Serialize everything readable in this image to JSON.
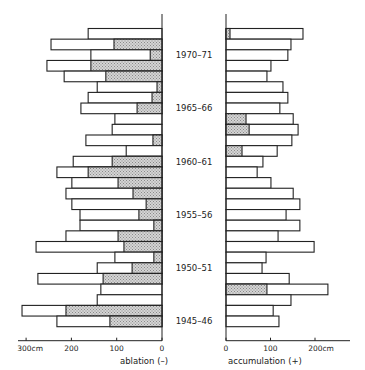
{
  "chart_data": {
    "type": "bar",
    "orientation": "horizontal",
    "title": "",
    "categories": [
      "1972-73",
      "1971-72",
      "1970-71",
      "1969-70",
      "1968-69",
      "1967-68",
      "1966-67",
      "1965-66",
      "1964-65",
      "1963-64",
      "1962-63",
      "1961-62",
      "1960-61",
      "1959-60",
      "1958-59",
      "1957-58",
      "1956-57",
      "1955-56",
      "1954-55",
      "1953-54",
      "1952-53",
      "1951-52",
      "1950-51",
      "1949-50",
      "1948-49",
      "1947-48",
      "1946-47",
      "1945-46"
    ],
    "year_labels": [
      "1970–71",
      "1965–66",
      "1960–61",
      "1955–56",
      "1950–51",
      "1945–46"
    ],
    "series": [
      {
        "name": "ablation total (-)",
        "side": "left",
        "values": [
          163,
          245,
          157,
          254,
          216,
          143,
          163,
          179,
          104,
          110,
          168,
          79,
          196,
          232,
          199,
          212,
          199,
          181,
          181,
          212,
          278,
          104,
          143,
          274,
          135,
          143,
          309,
          232
        ]
      },
      {
        "name": "ablation shaded portion (-)",
        "side": "left",
        "values": [
          0,
          106,
          26,
          157,
          124,
          11,
          22,
          55,
          0,
          0,
          20,
          0,
          110,
          163,
          97,
          64,
          35,
          51,
          18,
          97,
          84,
          18,
          66,
          130,
          0,
          0,
          212,
          115
        ]
      },
      {
        "name": "accumulation total (+)",
        "side": "right",
        "values": [
          173,
          146,
          139,
          101,
          92,
          128,
          139,
          121,
          151,
          162,
          148,
          115,
          83,
          70,
          101,
          151,
          166,
          135,
          166,
          117,
          198,
          90,
          81,
          142,
          229,
          146,
          106,
          119
        ]
      },
      {
        "name": "accumulation shaded portion (+)",
        "side": "right",
        "values": [
          9,
          0,
          0,
          0,
          0,
          0,
          0,
          0,
          45,
          52,
          0,
          36,
          0,
          0,
          0,
          0,
          0,
          0,
          0,
          0,
          0,
          0,
          0,
          0,
          92,
          0,
          0,
          0
        ]
      }
    ],
    "left_axis": {
      "label": "ablation  (–)",
      "ticks": [
        "300cm",
        "200",
        "100",
        "0"
      ],
      "range": [
        300,
        0
      ]
    },
    "right_axis": {
      "label": "accumulation  (+)",
      "ticks": [
        "0",
        "100",
        "200cm"
      ],
      "range": [
        0,
        250
      ]
    },
    "grid": false,
    "legend": "none"
  }
}
